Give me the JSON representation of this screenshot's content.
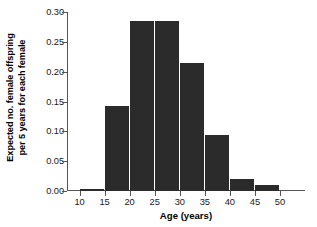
{
  "chart_data": {
    "type": "bar",
    "title": "",
    "subtitle": "",
    "xlabel": "Age (years)",
    "ylabel": "Expected no. female offspring per 5 years for each female",
    "ylabel_lines": [
      "Expected no. female offspring",
      "per 5 years for each female"
    ],
    "categories": [
      "10-15",
      "15-20",
      "20-25",
      "25-30",
      "30-35",
      "35-40",
      "40-45",
      "45-50"
    ],
    "bin_edges": [
      10,
      15,
      20,
      25,
      30,
      35,
      40,
      45,
      50
    ],
    "values": [
      0.003,
      0.143,
      0.285,
      0.285,
      0.215,
      0.094,
      0.02,
      0.01
    ],
    "xlim": [
      7.5,
      55
    ],
    "ylim": [
      0.0,
      0.3
    ],
    "xticks": [
      10,
      15,
      20,
      25,
      30,
      35,
      40,
      45,
      50
    ],
    "xtick_labels": [
      "10",
      "15",
      "20",
      "25",
      "30",
      "35",
      "40",
      "45",
      "50"
    ],
    "yticks": [
      0.0,
      0.05,
      0.1,
      0.15,
      0.2,
      0.25,
      0.3
    ],
    "ytick_labels": [
      "0.00",
      "0.05",
      "0.10",
      "0.15",
      "0.20",
      "0.25",
      "0.30"
    ],
    "grid": false,
    "legend": null,
    "legend_position": "none",
    "bar_color": "#2b2b2b",
    "axis_color": "#555555",
    "background_color": "#ffffff",
    "bar_align": "edge"
  }
}
